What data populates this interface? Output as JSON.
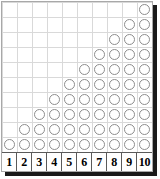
{
  "figure": {
    "title": "",
    "columns": 10,
    "rows": 10,
    "axis_labels": [
      "1",
      "2",
      "3",
      "4",
      "5",
      "6",
      "7",
      "8",
      "9",
      "10"
    ],
    "marker": "circle-outline",
    "colors": {
      "marker_stroke": "#8d8d8d",
      "gridline": "#d9d9d9",
      "panel_border": "#a8a8a8",
      "axis_border": "#5a5a5a",
      "shadow": "#1a1a1a",
      "background": "#ffffff",
      "label_text": "#000000"
    }
  },
  "chart_data": {
    "type": "bar",
    "title": "",
    "subtitle": "",
    "xlabel": "",
    "ylabel": "",
    "categories": [
      "1",
      "2",
      "3",
      "4",
      "5",
      "6",
      "7",
      "8",
      "9",
      "10"
    ],
    "values": [
      1,
      2,
      3,
      4,
      5,
      6,
      7,
      8,
      9,
      10
    ],
    "series": [
      {
        "name": "counts",
        "values": [
          1,
          2,
          3,
          4,
          5,
          6,
          7,
          8,
          9,
          10
        ]
      }
    ],
    "xlim": [
      0,
      10
    ],
    "ylim": [
      0,
      10
    ],
    "grid": true,
    "legend": false,
    "legend_position": "none",
    "annotations": []
  }
}
